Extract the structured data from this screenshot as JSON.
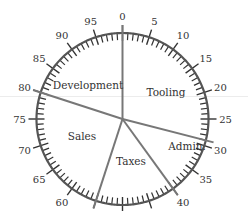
{
  "chart_data": {
    "type": "pie",
    "title": "",
    "scale": {
      "min": 0,
      "max": 100,
      "major_step": 5,
      "minor_step": 1
    },
    "tick_labels": [
      "0",
      "5",
      "10",
      "15",
      "20",
      "25",
      "30",
      "35",
      "40",
      "45",
      "50",
      "55",
      "60",
      "65",
      "70",
      "75",
      "80",
      "85",
      "90",
      "95"
    ],
    "boundaries": [
      0,
      29,
      40,
      55,
      80
    ],
    "categories": [
      "Tooling",
      "Admin.",
      "Taxes",
      "Sales",
      "Development"
    ],
    "values": [
      29,
      11,
      15,
      25,
      20
    ]
  },
  "colors": {
    "ring": "#555555",
    "divider": "#777777",
    "text": "#333333"
  }
}
